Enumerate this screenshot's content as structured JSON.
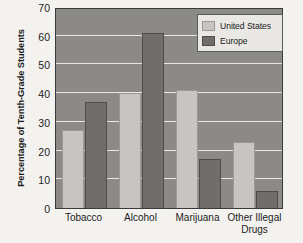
{
  "chart_data": {
    "type": "bar",
    "title": "",
    "xlabel": "",
    "ylabel": "Percentage of Tenth-Grade Students",
    "categories": [
      "Tobacco",
      "Alcohol",
      "Marijuana",
      "Other Illegal\nDrugs"
    ],
    "series": [
      {
        "name": "United States",
        "values": [
          27,
          40,
          41,
          23
        ],
        "color": "#c6c5c1"
      },
      {
        "name": "Europe",
        "values": [
          37,
          61,
          17,
          6
        ],
        "color": "#6f6e6b"
      }
    ],
    "ylim": [
      0,
      70
    ],
    "yticks": [
      0,
      10,
      20,
      30,
      40,
      50,
      60,
      70
    ],
    "ytick_labels": [
      "0",
      "10",
      "20",
      "30",
      "40",
      "50",
      "60",
      "70"
    ],
    "grid": true,
    "grid_axis": "y",
    "legend_position": "top-right",
    "plot_background": "#8b8a87",
    "figure_background": "#f3f2ef"
  }
}
